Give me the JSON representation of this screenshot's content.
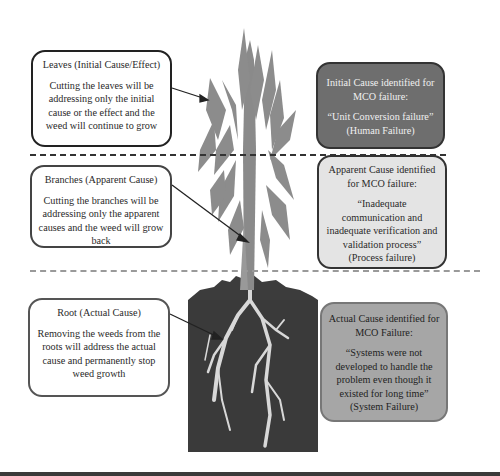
{
  "diagram": {
    "type": "root-cause-weed-analogy",
    "left_column": [
      {
        "id": "leaves",
        "title": "Leaves (Initial Cause/Effect)",
        "body": "Cutting the leaves will be addressing only the initial cause or the effect and the weed will continue to grow"
      },
      {
        "id": "branches",
        "title": "Branches (Apparent Cause)",
        "body": "Cutting the branches will be addressing only the apparent causes and the weed will grow back"
      },
      {
        "id": "root",
        "title": "Root (Actual Cause)",
        "body": "Removing the weeds from the roots will address the actual cause and permanently stop weed growth"
      }
    ],
    "right_column": [
      {
        "id": "initial",
        "title": "Initial Cause identified for MCO failure:",
        "quote": "“Unit Conversion failure”",
        "category": "(Human Failure)",
        "fill": "#6e6e6e"
      },
      {
        "id": "apparent",
        "title": "Apparent Cause identified for MCO failure:",
        "quote": "“Inadequate communication and inadequate verification and validation process”",
        "category": "(Process failure)",
        "fill": "#e4e4e4"
      },
      {
        "id": "actual",
        "title": "Actual Cause identified for MCO Failure:",
        "quote": "“Systems were not developed to handle the problem even though it existed for long time”",
        "category": "(System Failure)",
        "fill": "#a6a6a6"
      }
    ],
    "colors": {
      "plant": "#8a8a8a",
      "soil": "#3c3c3c",
      "roots": "#d8d8d8",
      "divider_top": "#333333",
      "divider_ground": "#9a9a9a"
    }
  }
}
